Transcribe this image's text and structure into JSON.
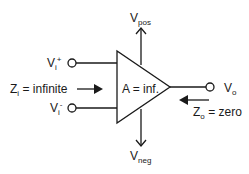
{
  "diagram": {
    "amplifier": {
      "label": "A = inf."
    },
    "supply": {
      "positive": {
        "main": "V",
        "sub": "pos"
      },
      "negative": {
        "main": "V",
        "sub": "neg"
      }
    },
    "inputs": {
      "non_inverting": {
        "main": "V",
        "sub": "i",
        "sup": "+"
      },
      "inverting": {
        "main": "V",
        "sub": "i",
        "sup": "-"
      },
      "impedance": {
        "main": "Z",
        "sub": "i",
        "rest": " = infinite"
      }
    },
    "output": {
      "voltage": {
        "main": "V",
        "sub": "o"
      },
      "impedance": {
        "main": "Z",
        "sub": "o",
        "rest": " = zero"
      }
    },
    "colors": {
      "stroke": "#1a1a1a",
      "background": "#ffffff"
    }
  }
}
